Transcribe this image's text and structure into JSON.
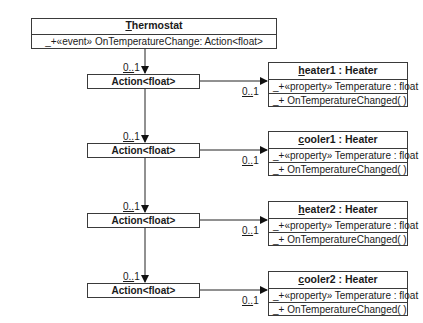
{
  "thermostat": {
    "name": "Thermostat",
    "attribute": "_+«event» OnTemperatureChange: Action<float>"
  },
  "actions": [
    {
      "label": "Action<float>",
      "mult_in": "0..1",
      "mult_out": "0..1"
    },
    {
      "label": "Action<float>",
      "mult_in": "0..1",
      "mult_out": "0..1"
    },
    {
      "label": "Action<float>",
      "mult_in": "0..1",
      "mult_out": "0..1"
    },
    {
      "label": "Action<float>",
      "mult_in": "0..1",
      "mult_out": "0..1"
    }
  ],
  "objects": [
    {
      "name": "heater1 : Heater",
      "property": "_+«property» Temperature : float",
      "method": "_+ OnTemperatureChanged( )"
    },
    {
      "name": "cooler1 : Heater",
      "property": "_+«property» Temperature : float",
      "method": "_+ OnTemperatureChanged( )"
    },
    {
      "name": "heater2 : Heater",
      "property": "_+«property» Temperature : float",
      "method": "_+ OnTemperatureChanged( )"
    },
    {
      "name": "cooler2 : Heater",
      "property": "_+«property» Temperature : float",
      "method": "_+ OnTemperatureChanged( )"
    }
  ]
}
